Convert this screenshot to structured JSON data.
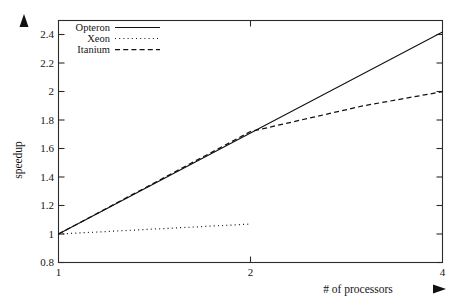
{
  "chart_data": {
    "type": "line",
    "title": "",
    "xlabel": "# of processors",
    "ylabel": "speedup",
    "xscale": "log2",
    "xlim": [
      1,
      4
    ],
    "ylim": [
      0.8,
      2.5
    ],
    "xticks": [
      "1",
      "2",
      "4"
    ],
    "xtick_values": [
      1,
      2,
      4
    ],
    "yticks": [
      "0.8",
      "1",
      "1.2",
      "1.4",
      "1.6",
      "1.8",
      "2",
      "2.2",
      "2.4"
    ],
    "ytick_values": [
      0.8,
      1,
      1.2,
      1.4,
      1.6,
      1.8,
      2,
      2.2,
      2.4
    ],
    "grid": false,
    "legend_position": "top-left",
    "series": [
      {
        "name": "Opteron",
        "style": "solid",
        "color": "#111111",
        "x": [
          1,
          2,
          4
        ],
        "values": [
          1.0,
          1.71,
          2.42
        ]
      },
      {
        "name": "Xeon",
        "style": "dotted",
        "color": "#111111",
        "x": [
          1,
          2
        ],
        "values": [
          1.0,
          1.07
        ]
      },
      {
        "name": "Itanium",
        "style": "dashed",
        "color": "#111111",
        "x": [
          1,
          2,
          3,
          4
        ],
        "values": [
          1.0,
          1.72,
          1.9,
          2.0
        ]
      }
    ]
  },
  "axes": {
    "y_arrow": "up-arrow-marker",
    "x_arrow": "right-arrow-marker"
  }
}
